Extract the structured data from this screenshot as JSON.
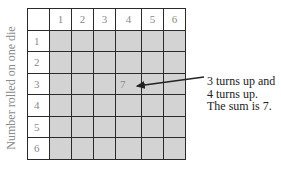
{
  "y_axis_label": "Number rolled on one die",
  "column_headers": [
    "1",
    "2",
    "3",
    "4",
    "5",
    "6"
  ],
  "row_headers": [
    "1",
    "2",
    "3",
    "4",
    "5",
    "6"
  ],
  "highlighted_cell": {
    "row": 3,
    "column": 4,
    "value": "7"
  },
  "callout": {
    "lines": [
      "3 turns up and",
      "4 turns up.",
      "The sum is 7."
    ]
  },
  "colors": {
    "cell_fill": "#d3d3d3",
    "grid_line": "#2a2a2a",
    "label_gray": "#8a8a8a"
  }
}
